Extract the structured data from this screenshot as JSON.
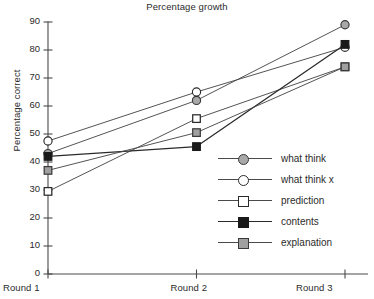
{
  "chart_data": {
    "type": "line",
    "title": "Percentage growth",
    "xlabel": "",
    "ylabel": "Percentage correct",
    "categories": [
      "Round 1",
      "Round 2",
      "Round 3"
    ],
    "ylim": [
      0,
      90
    ],
    "ytick_step": 10,
    "yticks": [
      0,
      10,
      20,
      30,
      40,
      50,
      60,
      70,
      80,
      90
    ],
    "ytick_labels": [
      "0",
      "10",
      "20",
      "30",
      "40",
      "50",
      "60",
      "70",
      "80",
      "90"
    ],
    "grid": false,
    "legend_position": "inside-right-middle",
    "series": [
      {
        "name": "what think",
        "marker": "circle-gray",
        "marker_fill": "#a8a8a8",
        "line_color": "#4a4a4a",
        "values": [
          43,
          62,
          89
        ]
      },
      {
        "name": "what think x",
        "marker": "circle-white",
        "marker_fill": "#ffffff",
        "line_color": "#4a4a4a",
        "values": [
          47.5,
          65,
          81
        ]
      },
      {
        "name": "prediction",
        "marker": "square-white",
        "marker_fill": "#ffffff",
        "line_color": "#4a4a4a",
        "values": [
          29.5,
          55.5,
          74
        ]
      },
      {
        "name": "contents",
        "marker": "square-black",
        "marker_fill": "#1a1a1a",
        "line_color": "#2a2a2a",
        "values": [
          42,
          45.5,
          82
        ]
      },
      {
        "name": "explanation",
        "marker": "square-gray",
        "marker_fill": "#a0a0a0",
        "line_color": "#4a4a4a",
        "values": [
          37,
          50.5,
          74
        ]
      }
    ]
  },
  "legend": {
    "items": [
      {
        "label": "what think"
      },
      {
        "label": "what think x"
      },
      {
        "label": "prediction"
      },
      {
        "label": "contents"
      },
      {
        "label": "explanation"
      }
    ]
  },
  "axis": {
    "y_label": "Percentage correct",
    "y_ticks": [
      "90",
      "80",
      "70",
      "60",
      "50",
      "40",
      "30",
      "20",
      "10",
      "0"
    ],
    "x_ticks": [
      "Round 1",
      "Round 2",
      "Round 3"
    ]
  },
  "colors": {
    "axis": "#4a4a4a",
    "text": "#2b2b2b",
    "series_gray": "#a8a8a8",
    "series_black": "#1a1a1a",
    "series_white": "#ffffff"
  }
}
